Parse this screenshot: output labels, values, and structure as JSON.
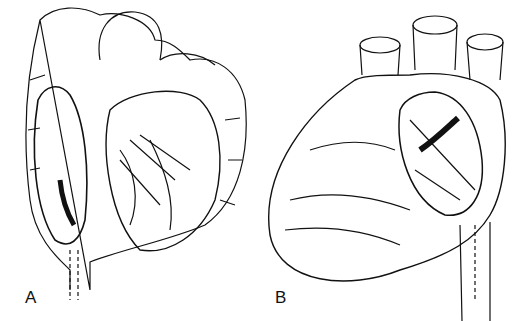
{
  "figure": {
    "panels": [
      {
        "id": "A",
        "label": "A",
        "description": "Heart cut-away view showing interior chambers, valves and papillary muscles, with catheter lead descending"
      },
      {
        "id": "B",
        "label": "B",
        "description": "Heart external view with great vessels on top and opened atrium window, catheter lead descending"
      }
    ],
    "colors": {
      "ink": "#111111",
      "background": "#ffffff"
    }
  }
}
